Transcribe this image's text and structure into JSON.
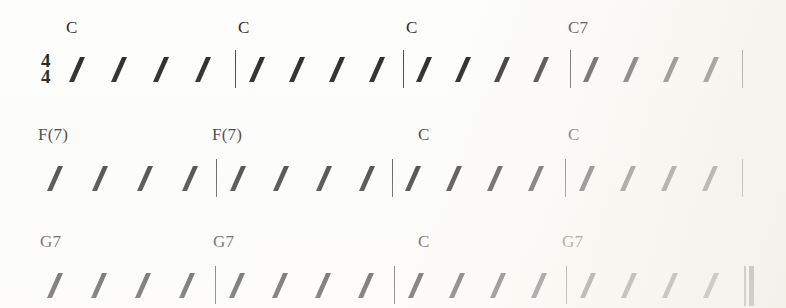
{
  "document": {
    "type": "chord-chart",
    "title": "Chord chart with rhythm slashes",
    "time_signature": {
      "numerator": "4",
      "denominator": "4"
    },
    "ink_color": "#1a1a1a",
    "paper_color": "#fdfdfb",
    "beats_per_measure": 4,
    "measures_per_system": 4,
    "systems": [
      {
        "index": 1,
        "chords": [
          "C",
          "C",
          "C",
          "C7"
        ],
        "measures": [
          {
            "chord": "C",
            "slashes": 4
          },
          {
            "chord": "C",
            "slashes": 4
          },
          {
            "chord": "C",
            "slashes": 4
          },
          {
            "chord": "C7",
            "slashes": 4
          }
        ],
        "start_barline": "none",
        "end_barline": "single"
      },
      {
        "index": 2,
        "chords": [
          "F(7)",
          "F(7)",
          "C",
          "C"
        ],
        "measures": [
          {
            "chord": "F(7)",
            "slashes": 4
          },
          {
            "chord": "F(7)",
            "slashes": 4
          },
          {
            "chord": "C",
            "slashes": 4
          },
          {
            "chord": "C",
            "slashes": 4
          }
        ],
        "start_barline": "none",
        "end_barline": "single"
      },
      {
        "index": 3,
        "chords": [
          "G7",
          "G7",
          "C",
          "G7"
        ],
        "measures": [
          {
            "chord": "G7",
            "slashes": 4
          },
          {
            "chord": "G7",
            "slashes": 4
          },
          {
            "chord": "C",
            "slashes": 4
          },
          {
            "chord": "G7",
            "slashes": 4
          }
        ],
        "start_barline": "none",
        "end_barline": "final"
      }
    ],
    "layout": {
      "system_tops": [
        18,
        125,
        232
      ],
      "chord_offset_y": 0,
      "staff_offset_y": 32,
      "measure_starts": [
        62,
        235,
        403,
        570
      ],
      "measure_width": 168,
      "slash_step": 42,
      "barline_x": [
        235,
        403,
        570
      ],
      "system_end_x": 742,
      "final_barline_x": 744
    }
  }
}
